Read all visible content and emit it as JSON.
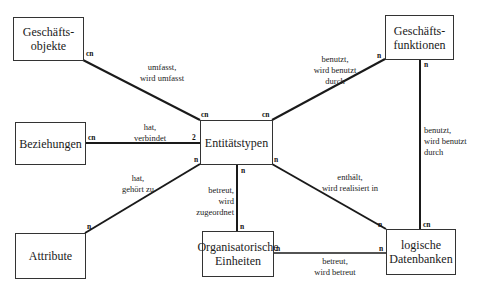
{
  "entities": {
    "geschaeftsobjekte": "Geschäfts-\nobjekte",
    "geschaeftsfunktionen": "Geschäfts-\nfunktionen",
    "beziehungen": "Beziehungen",
    "entitaetstypen": "Entitätstypen",
    "attribute": "Attribute",
    "organisatorische_einheiten": "Organisatorische\nEinheiten",
    "logische_datenbanken": "logische\nDatenbanken"
  },
  "relations": {
    "objekte_entitaet": {
      "label": "umfasst,\nwird umfasst",
      "card_from": "cn",
      "card_to": "cn"
    },
    "funktionen_entitaet": {
      "label": "benutzt,\nwird benutzt\ndurch",
      "card_from": "n",
      "card_to": "cn"
    },
    "beziehungen_entitaet": {
      "label": "hat,\nverbindet",
      "card_from": "cn",
      "card_to": "2"
    },
    "attribute_entitaet": {
      "label": "hat,\ngehört zu",
      "card_from": "n",
      "card_to": "n"
    },
    "entitaet_org": {
      "label": "betreut,\nwird\nzugeordnet",
      "card_to": "n"
    },
    "entitaet_datenbanken": {
      "label": "enthält,\nwird realisiert in",
      "card_from": "n",
      "card_to": "n"
    },
    "funktionen_datenbanken": {
      "label": "benutzt,\nwird benutzt\ndurch",
      "card_from": "n",
      "card_to": "cn"
    },
    "org_datenbanken": {
      "label": "betreut,\nwird betreut",
      "card_from": "n",
      "card_to": "n"
    }
  },
  "colors": {
    "line": "#1a1a1a",
    "box_border": "#333333",
    "background": "#ffffff"
  }
}
